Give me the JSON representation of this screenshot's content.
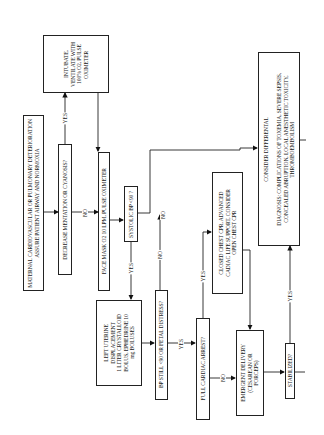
{
  "diagram": {
    "orientation": "rotated 90° counter-clockwise",
    "nodes": {
      "start": "MATERNAL CARDIOVASCULAR OR PULMONARY DETERIORATION\nASSURE PATIENT AIRWAY AND NORMOXIA",
      "decrease_mentation": "DECREASE MENTATION OR CYANOSIS?",
      "intubate": "INTUBATE,\nVENTILATE WITH\n100% O2, PULSE\nOXIMETER",
      "face_mask": "FACE MASK O2 10 LPM, PULSE OXIMETER",
      "systolic_bp": "SYSTOLIC BP <90 ?",
      "left_uterine": "LEFT UTERINE\nDISPLACEMENT\n1 LITER CRYSTALLOID\nBOLUS, EPHEDRINE 10\nmg BOLUSES",
      "bp_still": "BP STILL <90 OR FETAL DISTRESS?",
      "full_arrest": "FULL CARDIAC ARREST?",
      "closed_cpr": "CLOSED CHEST CPR, ADVANCED\nCADIAC LIFE SUPPORT, CONSIDER\nOPEN CHEST CPR",
      "emergent_delivery": "EMERGENT DELIVERY\n(CESAREAN OR\nFORCEPS)",
      "stabilized": "STABILIZED?",
      "differential": "CONSIDER DIFFERENTAL\n\nDIAGNOSIS:  COMPLICATIONS OF TOXEMIA, SEVERE SEPSIS,\nCONCEALED ABRUPTION, LOCAL ANESTHETIC TOXICITY,\nTHROMBOEMBOLISM"
    },
    "edge_labels": {
      "mentation_yes": "YES",
      "mentation_no": "NO",
      "systolic_yes": "YES",
      "systolic_no": "NO",
      "bp_still_no": "NO",
      "bp_still_yes": "YES",
      "arrest_yes": "YES",
      "arrest_no": "NO",
      "stabilized_yes": "YES"
    }
  }
}
